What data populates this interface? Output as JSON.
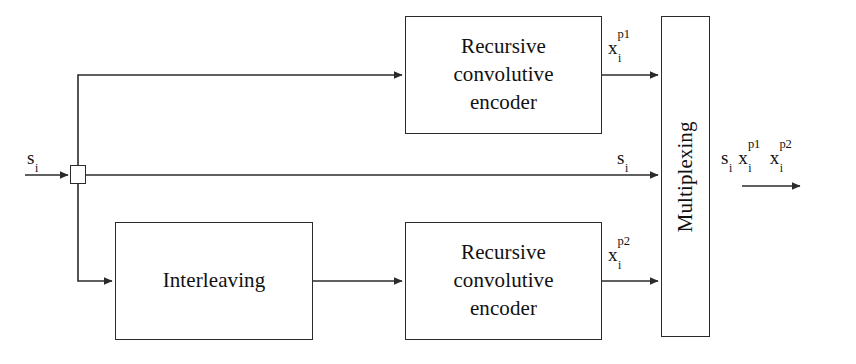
{
  "figure": {
    "type": "block-diagram"
  },
  "blocks": {
    "encoder_top": {
      "label": "Recursive\nconvolutive\nencoder",
      "name": "recursive-convolutive-encoder-top"
    },
    "encoder_bottom": {
      "label": "Recursive\nconvolutive\nencoder",
      "name": "recursive-convolutive-encoder-bottom"
    },
    "interleaving": {
      "label": "Interleaving",
      "name": "interleaving-block"
    },
    "multiplexing": {
      "label": "Multiplexing",
      "name": "multiplexing-block"
    },
    "split_node": {
      "label": "",
      "name": "signal-split-node"
    }
  },
  "signals": {
    "input": {
      "base": "s",
      "sub": "i",
      "sup": ""
    },
    "parity1": {
      "base": "x",
      "sub": "i",
      "sup": "p1"
    },
    "systematic_mid": {
      "base": "s",
      "sub": "i",
      "sup": ""
    },
    "parity2": {
      "base": "x",
      "sub": "i",
      "sup": "p2"
    },
    "output": [
      {
        "base": "s",
        "sub": "i",
        "sup": ""
      },
      {
        "base": "x",
        "sub": "i",
        "sup": "p1"
      },
      {
        "base": "x",
        "sub": "i",
        "sup": "p2"
      }
    ]
  },
  "colors": {
    "stroke": "#2b2b2b",
    "text": "#111111",
    "background": "#ffffff"
  }
}
